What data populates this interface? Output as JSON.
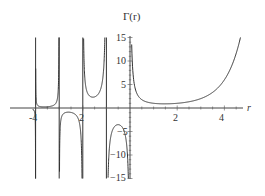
{
  "chart_data": {
    "type": "line",
    "title": "Γ(r)",
    "xlabel": "r",
    "ylabel": "Γ(r)",
    "function": "Gamma function Γ(r)",
    "xlim": [
      -4.1,
      4.8
    ],
    "ylim": [
      -15,
      15
    ],
    "x_ticks": [
      -4,
      -2,
      2,
      4
    ],
    "x_tick_labels": [
      "-4",
      "-2",
      "2",
      "4"
    ],
    "y_ticks": [
      -15,
      -10,
      -5,
      5,
      10,
      15
    ],
    "y_tick_labels": [
      "−15",
      "−10",
      "−5",
      "5",
      "10",
      "15"
    ],
    "vertical_asymptotes": [
      0,
      -1,
      -2,
      -3,
      -4
    ],
    "grid": false,
    "legend": null,
    "sample_points": [
      {
        "x": 0.5,
        "y": 1.772
      },
      {
        "x": 1,
        "y": 1
      },
      {
        "x": 1.46,
        "y": 0.886
      },
      {
        "x": 2,
        "y": 1
      },
      {
        "x": 3,
        "y": 2
      },
      {
        "x": 4,
        "y": 6
      },
      {
        "x": 4.7,
        "y": 15.4
      },
      {
        "x": -0.5,
        "y": -3.545
      },
      {
        "x": -1.5,
        "y": 2.363
      },
      {
        "x": -2.5,
        "y": -0.945
      },
      {
        "x": -3.5,
        "y": 0.27
      }
    ]
  },
  "labels": {
    "title": "Γ(r)",
    "xaxis": "r",
    "x_ticks": [
      "-4",
      "2",
      "2",
      "4"
    ],
    "y_ticks": [
      "15",
      "10",
      "5",
      "−5",
      "−10",
      "−15"
    ]
  }
}
